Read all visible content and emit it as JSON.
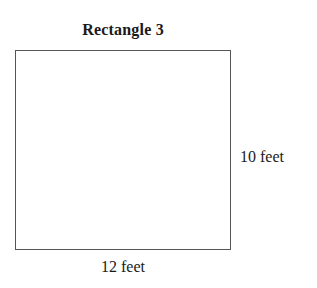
{
  "diagram": {
    "title": "Rectangle 3",
    "shape": "rectangle",
    "side_label": "10 feet",
    "bottom_label": "12 feet",
    "colors": {
      "stroke": "#555555",
      "text": "#1a1a1a",
      "background": "#ffffff"
    }
  }
}
